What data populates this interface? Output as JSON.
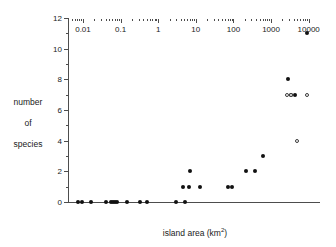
{
  "chart_data": {
    "type": "scatter",
    "title": "",
    "xlabel": "island area (km²)",
    "xlabel_text": "island area (km",
    "xlabel_sup": "2",
    "xlabel_tail": ")",
    "ylabel_lines": [
      "number",
      "of",
      "species"
    ],
    "ylabel": "number of species",
    "xscale": "log",
    "yscale": "linear",
    "xlim": [
      0.004,
      20000
    ],
    "ylim": [
      0,
      12
    ],
    "grid": false,
    "legend": "none",
    "xticks": [
      0.01,
      0.1,
      1,
      10,
      100,
      1000,
      10000
    ],
    "xtick_labels": [
      "0.01",
      "0.1",
      "1",
      "10",
      "100",
      "1000",
      "10000"
    ],
    "yticks": [
      0,
      2,
      4,
      6,
      8,
      10,
      12
    ],
    "ytick_labels": [
      "0",
      "2",
      "4",
      "6",
      "8",
      "10",
      "12"
    ],
    "yminor_ticks": [
      1,
      3,
      5,
      7,
      9,
      11
    ],
    "series": [
      {
        "name": "filled",
        "marker": "filled-circle",
        "color": "#111111",
        "points": [
          {
            "x": 0.0072,
            "y": 0
          },
          {
            "x": 0.0092,
            "y": 0
          },
          {
            "x": 0.016,
            "y": 0
          },
          {
            "x": 0.042,
            "y": 0
          },
          {
            "x": 0.055,
            "y": 0
          },
          {
            "x": 0.062,
            "y": 0
          },
          {
            "x": 0.07,
            "y": 0
          },
          {
            "x": 0.079,
            "y": 0
          },
          {
            "x": 0.15,
            "y": 0
          },
          {
            "x": 0.33,
            "y": 0
          },
          {
            "x": 0.5,
            "y": 0
          },
          {
            "x": 2.9,
            "y": 0
          },
          {
            "x": 5.2,
            "y": 0
          },
          {
            "x": 4.6,
            "y": 1
          },
          {
            "x": 6.6,
            "y": 1
          },
          {
            "x": 13.0,
            "y": 1
          },
          {
            "x": 6.8,
            "y": 2
          },
          {
            "x": 72.0,
            "y": 1
          },
          {
            "x": 92.0,
            "y": 1
          },
          {
            "x": 215.0,
            "y": 2
          },
          {
            "x": 370.0,
            "y": 2
          },
          {
            "x": 620.0,
            "y": 3
          },
          {
            "x": 2900.0,
            "y": 8
          },
          {
            "x": 3300.0,
            "y": 7
          },
          {
            "x": 4300.0,
            "y": 7
          },
          {
            "x": 8800.0,
            "y": 11
          }
        ]
      },
      {
        "name": "open",
        "marker": "open-circle",
        "color": "#3a3a3a",
        "points": [
          {
            "x": 2700.0,
            "y": 7
          },
          {
            "x": 3300.0,
            "y": 7
          },
          {
            "x": 8800.0,
            "y": 7
          },
          {
            "x": 5000.0,
            "y": 4
          }
        ]
      }
    ]
  }
}
